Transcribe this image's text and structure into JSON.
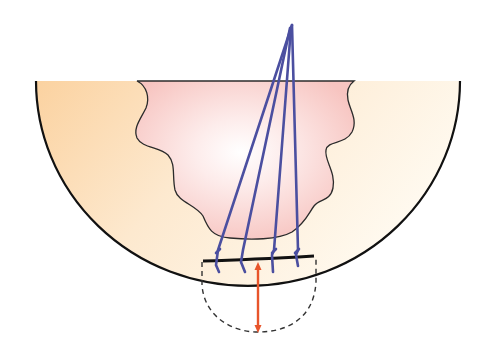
{
  "diagram": {
    "colors": {
      "background": "#ffffff",
      "bowl_left": "#fcd9a8",
      "bowl_right": "#fffaf0",
      "bowl_bottom": "#fffdf5",
      "inner_region": "#f8c6c2",
      "inner_center": "#ffffff",
      "outline": "#111111",
      "rays": "#4b4fa0",
      "measure_arrow": "#e8552b",
      "dashed": "#333333"
    },
    "elements": [
      {
        "name": "hemisphere-bowl",
        "description": "Half-circle bowl with orange-to-cream gradient fill"
      },
      {
        "name": "wavy-inner-region",
        "description": "Pink wavy-outlined region inside bowl"
      },
      {
        "name": "converging-rays",
        "count": 4,
        "description": "Four blue lines converging to a point above the bowl, each ending in a small hook"
      },
      {
        "name": "flat-bar",
        "description": "Thick black horizontal bar near bottom of bowl"
      },
      {
        "name": "dashed-extension",
        "description": "Dashed rounded region extending below bowl"
      },
      {
        "name": "depth-arrow",
        "description": "Orange double-headed vertical arrow"
      }
    ]
  }
}
